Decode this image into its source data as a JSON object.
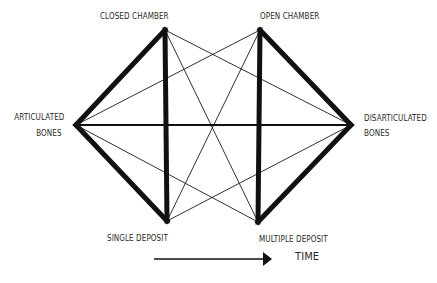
{
  "diagram": {
    "type": "relationship-network",
    "nodes": [
      {
        "id": "closed_chamber",
        "label": "CLOSED CHAMBER",
        "x": 165,
        "y": 30
      },
      {
        "id": "open_chamber",
        "label": "OPEN CHAMBER",
        "x": 260,
        "y": 30
      },
      {
        "id": "articulated_bones",
        "label_line1": "ARTICULATED",
        "label_line2": "BONES",
        "x": 76,
        "y": 125
      },
      {
        "id": "disarticulated_bones",
        "label_line1": "DISARTICULATED",
        "label_line2": "BONES",
        "x": 351,
        "y": 125
      },
      {
        "id": "single_deposit",
        "label": "SINGLE DEPOSIT",
        "x": 167,
        "y": 221
      },
      {
        "id": "multiple_deposit",
        "label": "MULTIPLE DEPOSIT",
        "x": 258,
        "y": 222
      }
    ],
    "thick_edges": [
      [
        "closed_chamber",
        "articulated_bones"
      ],
      [
        "closed_chamber",
        "single_deposit"
      ],
      [
        "articulated_bones",
        "single_deposit"
      ],
      [
        "open_chamber",
        "disarticulated_bones"
      ],
      [
        "open_chamber",
        "multiple_deposit"
      ],
      [
        "disarticulated_bones",
        "multiple_deposit"
      ]
    ],
    "medium_edges": [
      [
        "articulated_bones",
        "disarticulated_bones"
      ]
    ],
    "thin_edges": [
      [
        "articulated_bones",
        "open_chamber"
      ],
      [
        "closed_chamber",
        "disarticulated_bones"
      ],
      [
        "closed_chamber",
        "multiple_deposit"
      ],
      [
        "open_chamber",
        "single_deposit"
      ],
      [
        "articulated_bones",
        "multiple_deposit"
      ],
      [
        "single_deposit",
        "disarticulated_bones"
      ]
    ],
    "time_arrow": {
      "label": "TIME",
      "x1": 154,
      "x2": 272,
      "y": 259
    }
  },
  "labels": {
    "closed_chamber": "CLOSED CHAMBER",
    "open_chamber": "OPEN CHAMBER",
    "articulated_l1": "ARTICULATED",
    "articulated_l2": "BONES",
    "disarticulated_l1": "DISARTICULATED",
    "disarticulated_l2": "BONES",
    "single_deposit": "SINGLE DEPOSIT",
    "multiple_deposit": "MULTIPLE DEPOSIT",
    "time": "TIME"
  },
  "colors": {
    "ink": "#111111",
    "text": "#2a2a2a",
    "background": "#ffffff"
  }
}
